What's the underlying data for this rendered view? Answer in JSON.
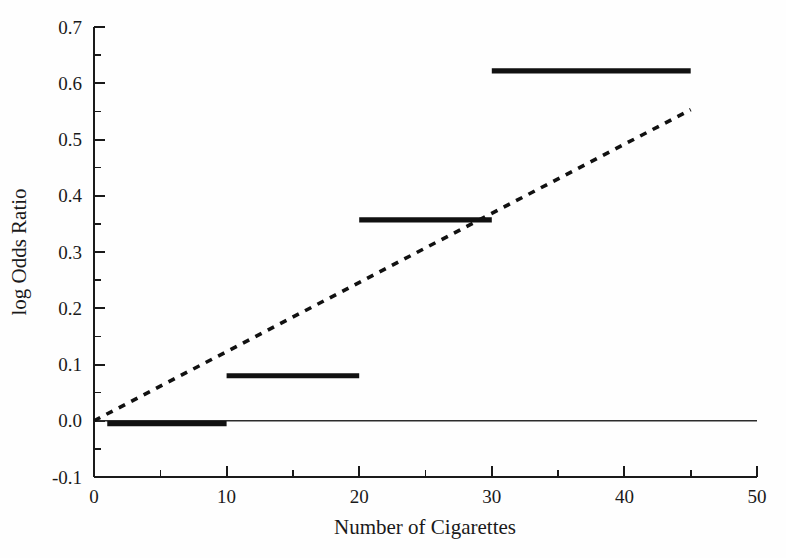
{
  "chart_data": {
    "type": "line",
    "title": "",
    "subtitle": "",
    "xlabel": "Number of Cigarettes",
    "ylabel": "log Odds Ratio",
    "xlim": [
      0,
      50
    ],
    "ylim": [
      -0.1,
      0.7
    ],
    "grid": false,
    "legend": "none",
    "x_ticks": [
      0,
      10,
      20,
      30,
      40,
      50
    ],
    "x_tick_labels": [
      "0",
      "10",
      "20",
      "30",
      "40",
      "50"
    ],
    "x_minor_ticks": [
      5,
      15,
      25,
      35,
      45
    ],
    "y_ticks": [
      -0.1,
      0.0,
      0.1,
      0.2,
      0.3,
      0.4,
      0.5,
      0.6,
      0.7
    ],
    "y_tick_labels": [
      "-0.1",
      "0.0",
      "0.1",
      "0.2",
      "0.3",
      "0.4",
      "0.5",
      "0.6",
      "0.7"
    ],
    "y_minor_ticks": [
      -0.05,
      0.05,
      0.15,
      0.25,
      0.35,
      0.45,
      0.55,
      0.65
    ],
    "series": [
      {
        "name": "Category step estimates",
        "style": "solid-thick-steps",
        "steps": [
          {
            "x_start": 1,
            "x_end": 10,
            "value": -0.005
          },
          {
            "x_start": 10,
            "x_end": 20,
            "value": 0.08
          },
          {
            "x_start": 20,
            "x_end": 30,
            "value": 0.357
          },
          {
            "x_start": 30,
            "x_end": 45,
            "value": 0.622
          }
        ]
      },
      {
        "name": "Linear trend",
        "style": "dashed",
        "points": [
          {
            "x": 0,
            "y": 0.0
          },
          {
            "x": 45,
            "y": 0.553
          }
        ]
      },
      {
        "name": "Zero reference",
        "style": "thin-solid",
        "points": [
          {
            "x": 0,
            "y": 0.0
          },
          {
            "x": 50,
            "y": 0.0
          }
        ]
      }
    ]
  },
  "axes": {
    "y_axis_title": "log Odds Ratio",
    "x_axis_title": "Number of Cigarettes"
  },
  "colors": {
    "foreground": "#1a1a1a",
    "line": "#111111",
    "background": "#fefefe"
  }
}
